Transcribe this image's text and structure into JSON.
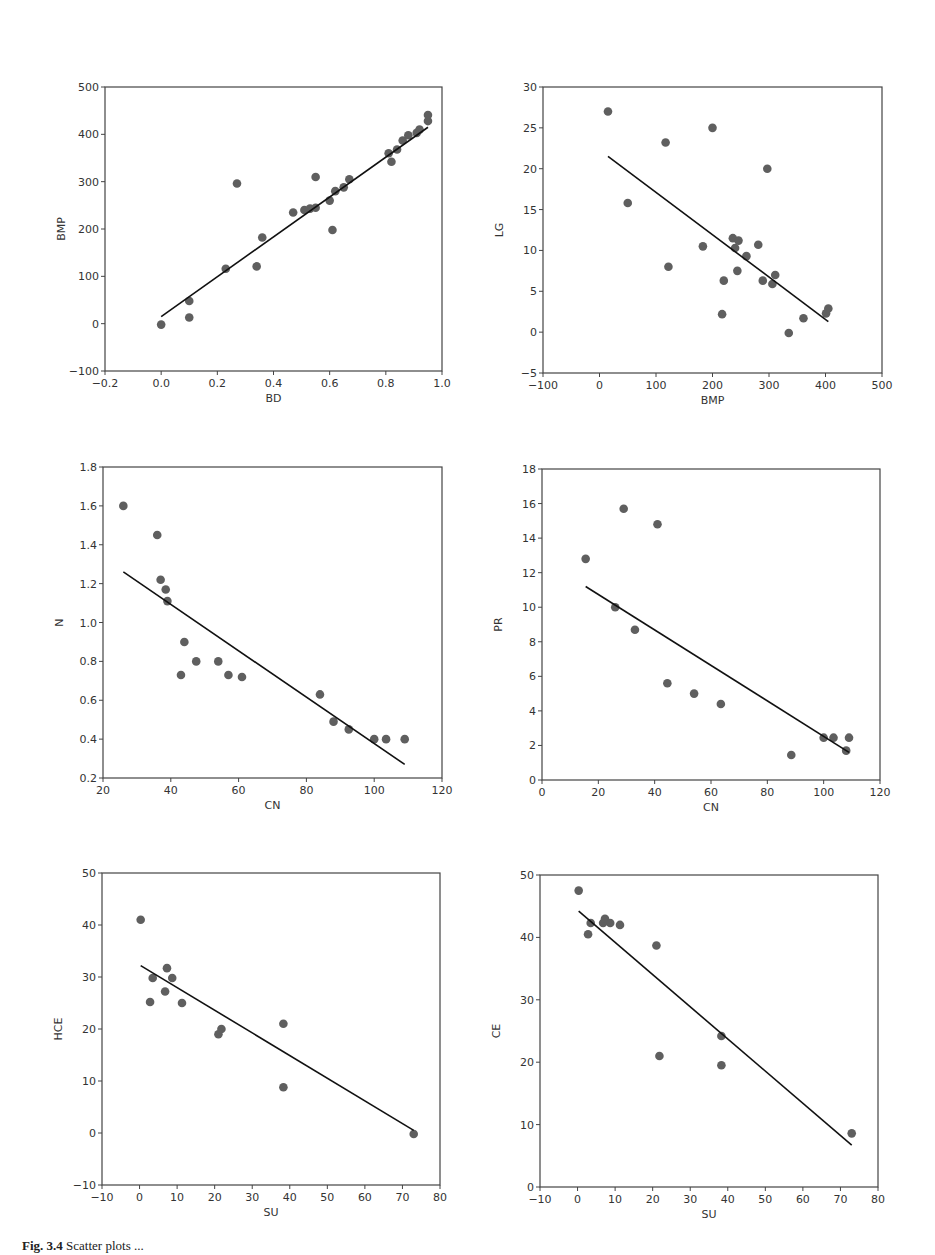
{
  "caption": {
    "label": "Fig. 3.4",
    "text": "Scatter plots ..."
  },
  "style": {
    "point_color": "#5f5f5f",
    "line_color": "#111111",
    "axis_color": "#444444"
  },
  "chart_data": [
    {
      "type": "scatter",
      "title": "",
      "xlabel": "BD",
      "ylabel": "BMP",
      "xlim": [
        -0.2,
        1.0
      ],
      "ylim": [
        -100,
        500
      ],
      "xticks": [
        -0.2,
        0.0,
        0.2,
        0.4,
        0.6,
        0.8,
        1.0
      ],
      "xtick_labels": [
        "−0.2",
        "0.0",
        "0.2",
        "0.4",
        "0.6",
        "0.8",
        "1.0"
      ],
      "yticks": [
        -100,
        0,
        100,
        200,
        300,
        400,
        500
      ],
      "ytick_labels": [
        "−100",
        "0",
        "100",
        "200",
        "300",
        "400",
        "500"
      ],
      "grid": false,
      "box": {
        "left": 105,
        "top": 87,
        "right": 442,
        "bottom": 371
      },
      "points": [
        [
          0.0,
          -2
        ],
        [
          0.1,
          48
        ],
        [
          0.1,
          13
        ],
        [
          0.23,
          116
        ],
        [
          0.27,
          296
        ],
        [
          0.34,
          121
        ],
        [
          0.36,
          182
        ],
        [
          0.47,
          235
        ],
        [
          0.51,
          240
        ],
        [
          0.53,
          243
        ],
        [
          0.55,
          245
        ],
        [
          0.55,
          310
        ],
        [
          0.6,
          260
        ],
        [
          0.61,
          198
        ],
        [
          0.62,
          280
        ],
        [
          0.65,
          288
        ],
        [
          0.67,
          305
        ],
        [
          0.81,
          360
        ],
        [
          0.82,
          342
        ],
        [
          0.84,
          368
        ],
        [
          0.86,
          387
        ],
        [
          0.88,
          398
        ],
        [
          0.91,
          403
        ],
        [
          0.92,
          410
        ],
        [
          0.95,
          428
        ],
        [
          0.95,
          441
        ]
      ],
      "fit_line": [
        [
          0.0,
          15
        ],
        [
          0.95,
          415
        ]
      ]
    },
    {
      "type": "scatter",
      "title": "",
      "xlabel": "BMP",
      "ylabel": "LG",
      "xlim": [
        -100,
        500
      ],
      "ylim": [
        -5,
        30
      ],
      "xticks": [
        -100,
        0,
        100,
        200,
        300,
        400,
        500
      ],
      "xtick_labels": [
        "−100",
        "0",
        "100",
        "200",
        "300",
        "400",
        "500"
      ],
      "yticks": [
        -5,
        0,
        5,
        10,
        15,
        20,
        25,
        30
      ],
      "ytick_labels": [
        "−5",
        "0",
        "5",
        "10",
        "15",
        "20",
        "25",
        "30"
      ],
      "grid": false,
      "box": {
        "left": 543,
        "top": 87,
        "right": 882,
        "bottom": 373
      },
      "points": [
        [
          15,
          27
        ],
        [
          50,
          15.8
        ],
        [
          117,
          23.2
        ],
        [
          122,
          8
        ],
        [
          183,
          10.5
        ],
        [
          200,
          25
        ],
        [
          217,
          2.2
        ],
        [
          220,
          6.3
        ],
        [
          236,
          11.5
        ],
        [
          240,
          10.3
        ],
        [
          244,
          7.5
        ],
        [
          246,
          11.2
        ],
        [
          260,
          9.3
        ],
        [
          281,
          10.7
        ],
        [
          289,
          6.3
        ],
        [
          297,
          20
        ],
        [
          306,
          5.9
        ],
        [
          311,
          7
        ],
        [
          335,
          -0.1
        ],
        [
          361,
          1.7
        ],
        [
          401,
          2.3
        ],
        [
          405,
          2.9
        ]
      ],
      "fit_line": [
        [
          15,
          21.5
        ],
        [
          405,
          1.3
        ]
      ]
    },
    {
      "type": "scatter",
      "title": "",
      "xlabel": "CN",
      "ylabel": "N",
      "xlim": [
        20,
        120
      ],
      "ylim": [
        0.2,
        1.8
      ],
      "xticks": [
        20,
        40,
        60,
        80,
        100,
        120
      ],
      "xtick_labels": [
        "20",
        "40",
        "60",
        "80",
        "100",
        "120"
      ],
      "yticks": [
        0.2,
        0.4,
        0.6,
        0.8,
        1.0,
        1.2,
        1.4,
        1.6,
        1.8
      ],
      "ytick_labels": [
        "0.2",
        "0.4",
        "0.6",
        "0.8",
        "1.0",
        "1.2",
        "1.4",
        "1.6",
        "1.8"
      ],
      "grid": false,
      "box": {
        "left": 103,
        "top": 467,
        "right": 442,
        "bottom": 778
      },
      "points": [
        [
          26,
          1.6
        ],
        [
          36,
          1.45
        ],
        [
          37,
          1.22
        ],
        [
          38.5,
          1.17
        ],
        [
          39,
          1.11
        ],
        [
          43,
          0.73
        ],
        [
          44,
          0.9
        ],
        [
          47.5,
          0.8
        ],
        [
          54,
          0.8
        ],
        [
          57,
          0.73
        ],
        [
          61,
          0.72
        ],
        [
          84,
          0.63
        ],
        [
          88,
          0.49
        ],
        [
          92.5,
          0.45
        ],
        [
          100,
          0.4
        ],
        [
          103.5,
          0.4
        ],
        [
          109,
          0.4
        ]
      ],
      "fit_line": [
        [
          26,
          1.26
        ],
        [
          109,
          0.27
        ]
      ]
    },
    {
      "type": "scatter",
      "title": "",
      "xlabel": "CN",
      "ylabel": "PR",
      "xlim": [
        0,
        120
      ],
      "ylim": [
        0,
        18
      ],
      "xticks": [
        0,
        20,
        40,
        60,
        80,
        100,
        120
      ],
      "xtick_labels": [
        "0",
        "20",
        "40",
        "60",
        "80",
        "100",
        "120"
      ],
      "yticks": [
        0,
        2,
        4,
        6,
        8,
        10,
        12,
        14,
        16,
        18
      ],
      "ytick_labels": [
        "0",
        "2",
        "4",
        "6",
        "8",
        "10",
        "12",
        "14",
        "16",
        "18"
      ],
      "grid": false,
      "box": {
        "left": 542,
        "top": 469,
        "right": 880,
        "bottom": 780
      },
      "points": [
        [
          15.5,
          12.8
        ],
        [
          26,
          10
        ],
        [
          29,
          15.7
        ],
        [
          33,
          8.7
        ],
        [
          41,
          14.8
        ],
        [
          44.5,
          5.6
        ],
        [
          54,
          5.0
        ],
        [
          63.5,
          4.4
        ],
        [
          88.5,
          1.45
        ],
        [
          100,
          2.45
        ],
        [
          103.5,
          2.45
        ],
        [
          108,
          1.7
        ],
        [
          109,
          2.45
        ]
      ],
      "fit_line": [
        [
          15.5,
          11.2
        ],
        [
          109,
          1.6
        ]
      ]
    },
    {
      "type": "scatter",
      "title": "",
      "xlabel": "SU",
      "ylabel": "HCE",
      "xlim": [
        -10,
        80
      ],
      "ylim": [
        -10,
        50
      ],
      "xticks": [
        -10,
        0,
        10,
        20,
        30,
        40,
        50,
        60,
        70,
        80
      ],
      "xtick_labels": [
        "−10",
        "0",
        "10",
        "20",
        "30",
        "40",
        "50",
        "60",
        "70",
        "80"
      ],
      "yticks": [
        -10,
        0,
        10,
        20,
        30,
        40,
        50
      ],
      "ytick_labels": [
        "−10",
        "0",
        "10",
        "20",
        "30",
        "40",
        "50"
      ],
      "grid": false,
      "box": {
        "left": 102,
        "top": 873,
        "right": 440,
        "bottom": 1185
      },
      "points": [
        [
          0.3,
          41
        ],
        [
          2.8,
          25.2
        ],
        [
          3.5,
          29.8
        ],
        [
          6.8,
          27.2
        ],
        [
          7.3,
          31.7
        ],
        [
          8.7,
          29.8
        ],
        [
          11.3,
          25
        ],
        [
          21,
          19
        ],
        [
          21.8,
          20
        ],
        [
          38.3,
          21
        ],
        [
          38.3,
          8.8
        ],
        [
          73,
          -0.2
        ]
      ],
      "fit_line": [
        [
          0.3,
          32.2
        ],
        [
          73,
          0.5
        ]
      ]
    },
    {
      "type": "scatter",
      "title": "",
      "xlabel": "SU",
      "ylabel": "CE",
      "xlim": [
        -10,
        80
      ],
      "ylim": [
        0,
        50
      ],
      "xticks": [
        -10,
        0,
        10,
        20,
        30,
        40,
        50,
        60,
        70,
        80
      ],
      "xtick_labels": [
        "−10",
        "0",
        "10",
        "20",
        "30",
        "40",
        "50",
        "60",
        "70",
        "80"
      ],
      "yticks": [
        0,
        10,
        20,
        30,
        40,
        50
      ],
      "ytick_labels": [
        "0",
        "10",
        "20",
        "30",
        "40",
        "50"
      ],
      "grid": false,
      "box": {
        "left": 540,
        "top": 875,
        "right": 878,
        "bottom": 1187
      },
      "points": [
        [
          0.3,
          47.5
        ],
        [
          2.8,
          40.5
        ],
        [
          3.5,
          42.3
        ],
        [
          6.8,
          42.3
        ],
        [
          7.3,
          43
        ],
        [
          8.7,
          42.3
        ],
        [
          11.3,
          42
        ],
        [
          21,
          38.7
        ],
        [
          21.8,
          21
        ],
        [
          38.3,
          24.2
        ],
        [
          38.3,
          19.5
        ],
        [
          73,
          8.6
        ]
      ],
      "fit_line": [
        [
          0.3,
          44.2
        ],
        [
          73,
          6.7
        ]
      ]
    }
  ]
}
